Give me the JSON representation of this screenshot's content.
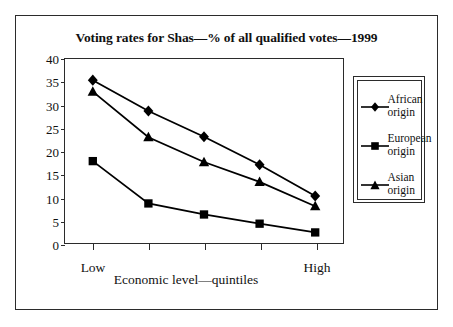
{
  "chart_data": {
    "type": "line",
    "title": "Voting rates for Shas—% of all qualified votes—1999",
    "xlabel": "Economic level—quintiles",
    "ylabel": "",
    "x": [
      1,
      2,
      3,
      4,
      5
    ],
    "categories": [
      "1",
      "2",
      "3",
      "4",
      "5"
    ],
    "xtick_labels": [
      "Low",
      "High"
    ],
    "x_low_label": "Low",
    "x_high_label": "High",
    "ylim": [
      0,
      40
    ],
    "yticks": [
      0,
      5,
      10,
      15,
      20,
      25,
      30,
      35,
      40
    ],
    "ytick_labels": [
      "0",
      "5",
      "10",
      "15",
      "20",
      "25",
      "30",
      "35",
      "40"
    ],
    "grid": false,
    "legend_position": "right",
    "series": [
      {
        "name": "African origin",
        "label_line1": "African",
        "label_line2": "origin",
        "marker": "diamond",
        "color": "#000000",
        "values": [
          35.4,
          28.7,
          23.1,
          17.0,
          10.2
        ]
      },
      {
        "name": "European origin",
        "label_line1": "European",
        "label_line2": "origin",
        "marker": "square",
        "color": "#000000",
        "values": [
          17.8,
          8.6,
          6.2,
          4.2,
          2.3
        ]
      },
      {
        "name": "Asian origin",
        "label_line1": "Asian",
        "label_line2": "origin",
        "marker": "triangle",
        "color": "#000000",
        "values": [
          32.9,
          23.0,
          17.6,
          13.3,
          8.0
        ]
      }
    ]
  }
}
